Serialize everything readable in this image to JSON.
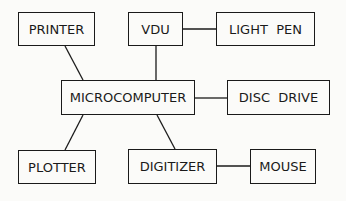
{
  "diagram": {
    "type": "block-diagram",
    "nodes": [
      {
        "id": "printer",
        "label": "PRINTER",
        "x": 18,
        "y": 12,
        "w": 77,
        "h": 34
      },
      {
        "id": "vdu",
        "label": "VDU",
        "x": 128,
        "y": 12,
        "w": 55,
        "h": 34
      },
      {
        "id": "light_pen",
        "label": "LIGHT  PEN",
        "x": 216,
        "y": 12,
        "w": 99,
        "h": 34
      },
      {
        "id": "microcomputer",
        "label": "MICROCOMPUTER",
        "x": 61,
        "y": 80,
        "w": 134,
        "h": 35
      },
      {
        "id": "disc_drive",
        "label": "DISC  DRIVE",
        "x": 227,
        "y": 80,
        "w": 103,
        "h": 35
      },
      {
        "id": "plotter",
        "label": "PLOTTER",
        "x": 18,
        "y": 150,
        "w": 78,
        "h": 34
      },
      {
        "id": "digitizer",
        "label": "DIGITIZER",
        "x": 128,
        "y": 149,
        "w": 89,
        "h": 35
      },
      {
        "id": "mouse",
        "label": "MOUSE",
        "x": 250,
        "y": 149,
        "w": 66,
        "h": 35
      }
    ],
    "edges": [
      {
        "from": "printer",
        "to": "microcomputer",
        "x1": 65,
        "y1": 46,
        "x2": 83,
        "y2": 80
      },
      {
        "from": "vdu",
        "to": "microcomputer",
        "x1": 156,
        "y1": 46,
        "x2": 156,
        "y2": 80
      },
      {
        "from": "vdu",
        "to": "light_pen",
        "x1": 183,
        "y1": 29,
        "x2": 216,
        "y2": 29
      },
      {
        "from": "microcomputer",
        "to": "disc_drive",
        "x1": 195,
        "y1": 98,
        "x2": 227,
        "y2": 98
      },
      {
        "from": "microcomputer",
        "to": "plotter",
        "x1": 83,
        "y1": 115,
        "x2": 65,
        "y2": 150
      },
      {
        "from": "microcomputer",
        "to": "digitizer",
        "x1": 157,
        "y1": 115,
        "x2": 175,
        "y2": 149
      },
      {
        "from": "digitizer",
        "to": "mouse",
        "x1": 217,
        "y1": 166,
        "x2": 250,
        "y2": 166
      }
    ]
  },
  "colors": {
    "background": "#fbfbf9",
    "stroke": "#1a1a1a",
    "text": "#1a1a1a"
  }
}
